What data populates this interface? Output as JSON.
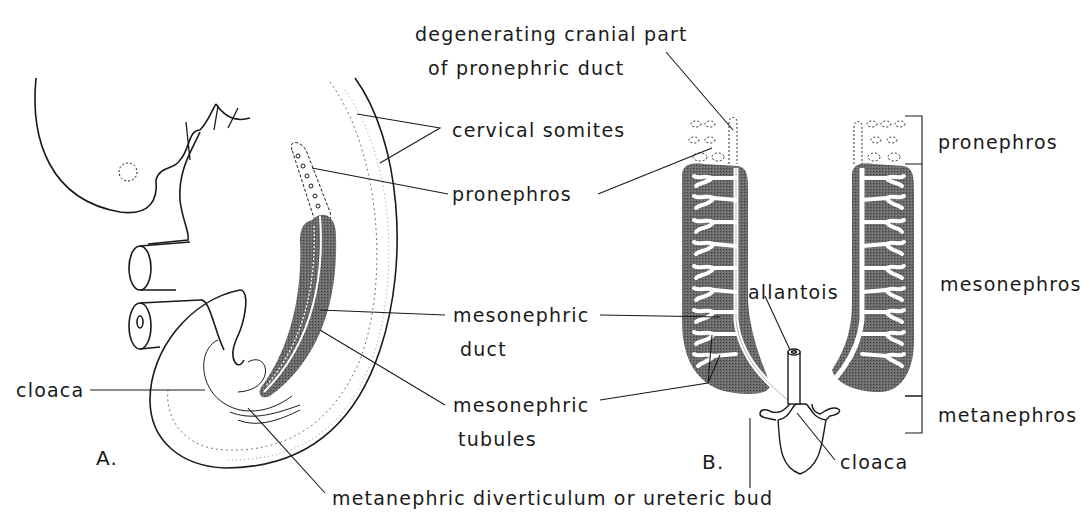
{
  "figure": {
    "panels": [
      {
        "id": "A",
        "label": "A."
      },
      {
        "id": "B",
        "label": "B."
      }
    ],
    "labels": {
      "degenerating_line1": "degenerating cranial part",
      "degenerating_line2": "of pronephric duct",
      "cervical_somites": "cervical somites",
      "pronephros": "pronephros",
      "mesonephric_duct_line1": "mesonephric",
      "mesonephric_duct_line2": "duct",
      "mesonephric_tubules_line1": "mesonephric",
      "mesonephric_tubules_line2": "tubules",
      "cloaca_a": "cloaca",
      "metanephric": "metanephric diverticulum or ureteric bud",
      "allantois": "allantois",
      "cloaca_b": "cloaca"
    },
    "regions": [
      {
        "name": "pronephros",
        "label": "pronephros"
      },
      {
        "name": "mesonephros",
        "label": "mesonephros"
      },
      {
        "name": "metanephros",
        "label": "metanephros"
      }
    ],
    "colors": {
      "ink": "#1a1a1a",
      "kidney_fill": "#5a5a5a",
      "background": "#ffffff"
    }
  }
}
